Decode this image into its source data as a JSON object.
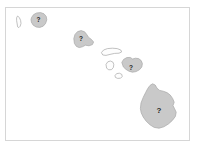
{
  "figure": {
    "kind": "map",
    "region": "Hawaiian Islands",
    "background_color": "#ffffff",
    "frame_color": "#d6d6d6",
    "island_fill_labeled": "#c9c9c9",
    "island_fill_unlabeled": "#fdfdfd",
    "island_outline": "#a8a8a8",
    "marker_text_color": "#1f1f1f"
  },
  "islands": [
    {
      "name": "niihau",
      "label": "",
      "labeled": false,
      "marker_x": 20,
      "marker_y": 22,
      "path": "M17.6,16.0 L19.4,17.6 L20.6,20.4 L21.0,23.4 L20.2,26.2 L18.8,27.6 L17.6,26.8 L17.2,24.0 L16.6,20.6 L16.6,17.8 Z"
    },
    {
      "name": "kauai",
      "label": "?",
      "labeled": true,
      "marker_x": 38.5,
      "marker_y": 20.5,
      "path": "M31.6,17.4 L33.6,14.6 L36.6,13.0 L40.6,12.6 L44.0,13.8 L46.2,16.4 L46.8,19.8 L45.6,23.4 L43.2,26.2 L39.8,27.4 L36.2,27.0 L33.2,25.2 L31.4,22.2 L31.0,19.4 Z"
    },
    {
      "name": "oahu",
      "label": "?",
      "labeled": true,
      "marker_x": 81,
      "marker_y": 39,
      "path": "M73.8,38.6 L75.0,34.4 L77.6,31.6 L81.2,30.6 L84.6,31.8 L86.8,34.6 L88.6,37.4 L91.4,39.4 L93.6,42.0 L92.4,44.6 L89.0,45.8 L85.4,45.2 L82.4,46.8 L79.2,47.6 L76.4,46.4 L74.4,43.4 Z"
    },
    {
      "name": "molokai",
      "label": "",
      "labeled": false,
      "marker_x": 110,
      "marker_y": 52,
      "path": "M101.4,52.6 L103.6,50.0 L107.4,48.6 L112.4,48.2 L117.2,48.6 L120.8,50.0 L121.6,52.0 L119.0,53.2 L114.6,53.4 L110.0,54.4 L106.0,55.4 L102.8,55.0 Z"
    },
    {
      "name": "lanai",
      "label": "",
      "labeled": false,
      "marker_x": 110,
      "marker_y": 66,
      "path": "M106.0,64.4 L107.8,61.8 L110.4,61.0 L112.8,62.0 L113.8,64.4 L113.4,67.4 L111.6,69.6 L108.8,69.8 L106.6,68.2 Z"
    },
    {
      "name": "kahoolawe",
      "label": "",
      "labeled": false,
      "marker_x": 119,
      "marker_y": 76,
      "path": "M115.0,75.6 L116.6,73.6 L119.4,73.2 L121.8,74.4 L122.2,76.6 L120.6,78.2 L117.6,78.4 L115.4,77.4 Z"
    },
    {
      "name": "maui",
      "label": "?",
      "labeled": true,
      "marker_x": 131,
      "marker_y": 68,
      "path": "M121.8,62.4 L123.6,59.4 L126.8,57.6 L130.2,57.4 L132.6,59.0 L135.4,58.2 L138.6,58.6 L141.2,60.6 L142.4,63.6 L141.8,67.0 L139.4,69.8 L136.0,71.6 L132.4,72.2 L129.0,71.2 L126.0,69.4 L123.4,67.0 Z"
    },
    {
      "name": "hawaii",
      "label": "?",
      "labeled": true,
      "marker_x": 159,
      "marker_y": 111,
      "path": "M140.4,108.6 L141.0,103.0 L143.2,97.4 L145.6,92.6 L147.8,88.4 L150.0,85.4 L152.6,83.8 L155.2,85.0 L157.0,88.2 L159.6,90.4 L163.2,91.2 L167.0,92.6 L170.2,95.0 L172.6,98.4 L174.2,102.2 L173.0,105.6 L174.6,108.8 L176.2,112.2 L175.4,116.4 L172.4,120.4 L168.4,124.0 L163.8,126.8 L159.0,128.2 L154.2,127.4 L150.0,124.8 L146.2,121.2 L143.2,117.0 L141.2,112.8 Z"
    }
  ]
}
